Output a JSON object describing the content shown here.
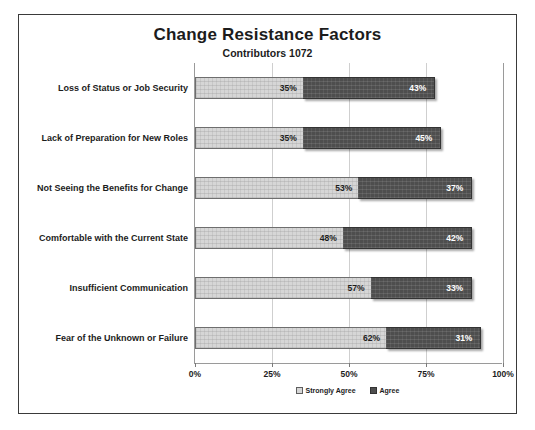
{
  "chart_data": {
    "type": "bar",
    "orientation": "horizontal",
    "stacked": true,
    "title": "Change Resistance Factors",
    "subtitle": "Contributors  1072",
    "xlabel": "",
    "ylabel": "",
    "xlim": [
      0,
      100
    ],
    "grid": true,
    "legend_position": "bottom",
    "x_tick_labels": [
      "0%",
      "25%",
      "50%",
      "75%",
      "100%"
    ],
    "x_tick_values": [
      0,
      25,
      50,
      75,
      100
    ],
    "categories": [
      "Loss of Status or Job Security",
      "Lack of Preparation for New Roles",
      "Not Seeing the Benefits for Change",
      "Comfortable with the Current State",
      "Insufficient Communication",
      "Fear of the Unknown or Failure"
    ],
    "series": [
      {
        "name": "Strongly Agree",
        "color": "#d6d6d6",
        "values": [
          35,
          35,
          53,
          48,
          57,
          62
        ],
        "labels": [
          "35%",
          "35%",
          "53%",
          "48%",
          "57%",
          "62%"
        ]
      },
      {
        "name": "Agree",
        "color": "#4e4e4e",
        "values": [
          43,
          45,
          37,
          42,
          33,
          31
        ],
        "labels": [
          "43%",
          "45%",
          "37%",
          "42%",
          "33%",
          "31%"
        ]
      }
    ]
  }
}
